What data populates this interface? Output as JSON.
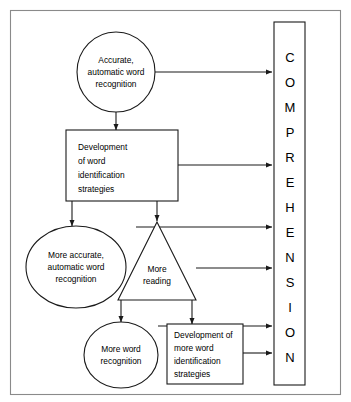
{
  "page": {
    "background_color": "#ffffff",
    "frame_color": "#8a8a8a",
    "line_color": "#1a1a1a"
  },
  "diagram": {
    "type": "flowchart",
    "outcome_bar": {
      "label": "COMPREHENSION",
      "letters": [
        "C",
        "O",
        "M",
        "P",
        "R",
        "E",
        "H",
        "E",
        "N",
        "S",
        "I",
        "O",
        "N"
      ],
      "orientation": "vertical"
    },
    "nodes": [
      {
        "id": "accurate-automatic-word-recognition",
        "shape": "ellipse",
        "lines": [
          "Accurate,",
          "automatic word",
          "recognition"
        ],
        "align": "center"
      },
      {
        "id": "development-of-word-identification-strategies",
        "shape": "rectangle",
        "lines": [
          "Development",
          "of word",
          "identification",
          "strategies"
        ],
        "align": "left"
      },
      {
        "id": "more-accurate-automatic-word-recognition",
        "shape": "ellipse",
        "lines": [
          "More accurate,",
          "automatic word",
          "recognition"
        ],
        "align": "center"
      },
      {
        "id": "more-reading",
        "shape": "triangle",
        "lines": [
          "More",
          "reading"
        ],
        "align": "center"
      },
      {
        "id": "more-word-recognition",
        "shape": "ellipse",
        "lines": [
          "More word",
          "recognition"
        ],
        "align": "center"
      },
      {
        "id": "development-of-more-word-identification-strategies",
        "shape": "rectangle",
        "lines": [
          "Development of",
          "more word",
          "identification",
          "strategies"
        ],
        "align": "left"
      }
    ],
    "connections": [
      {
        "from": "accurate-automatic-word-recognition",
        "to": "outcome-bar"
      },
      {
        "from": "accurate-automatic-word-recognition",
        "to": "development-of-word-identification-strategies"
      },
      {
        "from": "development-of-word-identification-strategies",
        "to": "outcome-bar"
      },
      {
        "from": "development-of-word-identification-strategies",
        "to": "more-accurate-automatic-word-recognition"
      },
      {
        "from": "development-of-word-identification-strategies",
        "to": "more-reading"
      },
      {
        "from": "more-accurate-automatic-word-recognition",
        "to": "outcome-bar"
      },
      {
        "from": "more-reading",
        "to": "outcome-bar"
      },
      {
        "from": "more-reading",
        "to": "more-word-recognition"
      },
      {
        "from": "more-reading",
        "to": "development-of-more-word-identification-strategies"
      },
      {
        "from": "more-word-recognition",
        "to": "outcome-bar"
      },
      {
        "from": "development-of-more-word-identification-strategies",
        "to": "outcome-bar"
      }
    ]
  }
}
